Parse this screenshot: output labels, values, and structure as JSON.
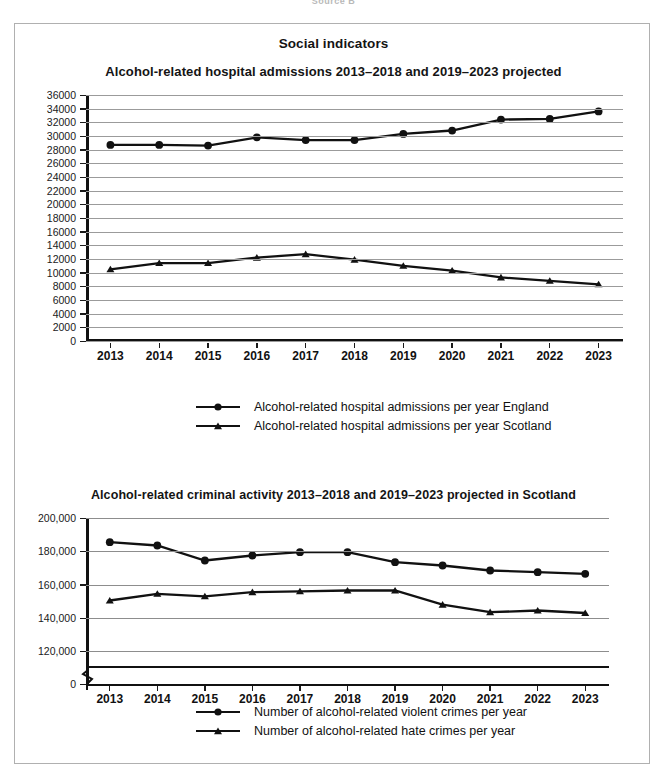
{
  "page": {
    "top_caption": "Source B",
    "heading": "Social indicators"
  },
  "chart_data": [
    {
      "id": "chart1",
      "type": "line",
      "title": "Alcohol-related hospital admissions 2013–2018 and 2019–2023 projected",
      "xlabel": "",
      "ylabel": "",
      "categories": [
        "2013",
        "2014",
        "2015",
        "2016",
        "2017",
        "2018",
        "2019",
        "2020",
        "2021",
        "2022",
        "2023"
      ],
      "ylim": [
        0,
        36000
      ],
      "ytick_step": 2000,
      "yticks": [
        "36000",
        "34000",
        "32000",
        "30000",
        "28000",
        "26000",
        "24000",
        "22000",
        "20000",
        "18000",
        "16000",
        "14000",
        "12000",
        "10000",
        "8000",
        "6000",
        "4000",
        "2000",
        "0"
      ],
      "grid": true,
      "legend_position": "bottom",
      "series": [
        {
          "name": "Alcohol-related hospital admissions per year England",
          "marker": "circle",
          "values": [
            28700,
            28700,
            28600,
            29800,
            29400,
            29400,
            30300,
            30800,
            32400,
            32500,
            33600
          ]
        },
        {
          "name": "Alcohol-related hospital admissions per year Scotland",
          "marker": "triangle",
          "values": [
            10500,
            11400,
            11400,
            12200,
            12700,
            11900,
            11000,
            10300,
            9300,
            8800,
            8300
          ]
        }
      ]
    },
    {
      "id": "chart2",
      "type": "line",
      "title": "Alcohol-related criminal activity 2013–2018 and 2019–2023 projected in Scotland",
      "xlabel": "",
      "ylabel": "",
      "categories": [
        "2013",
        "2014",
        "2015",
        "2016",
        "2017",
        "2018",
        "2019",
        "2020",
        "2021",
        "2022",
        "2023"
      ],
      "ylim": [
        110000,
        200000
      ],
      "ytick_step": 20000,
      "yticks": [
        "200,000",
        "180,000",
        "160,000",
        "140,000",
        "120,000",
        "0"
      ],
      "axis_break": true,
      "grid": true,
      "legend_position": "bottom",
      "series": [
        {
          "name": "Number of alcohol-related violent crimes per year",
          "marker": "circle",
          "values": [
            185500,
            183500,
            174500,
            177500,
            179500,
            179500,
            173500,
            171500,
            168500,
            167500,
            166500
          ]
        },
        {
          "name": "Number of alcohol-related hate crimes per year",
          "marker": "triangle",
          "values": [
            150500,
            154500,
            153000,
            155500,
            156000,
            156500,
            156500,
            148000,
            143500,
            144500,
            143000
          ]
        }
      ]
    }
  ]
}
